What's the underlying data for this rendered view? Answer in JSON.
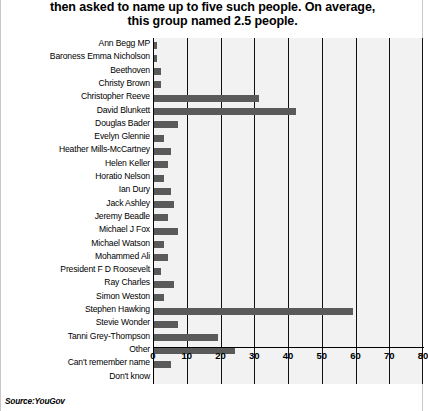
{
  "title": {
    "line1": "then asked to name up to five such people. On average,",
    "line2": "this group named 2.5 people."
  },
  "source": "Source:YouGov",
  "colors": {
    "bar": "#5a5a5a",
    "plot_background": "#f2f2f2",
    "gridline": "#111111",
    "text": "#000000"
  },
  "chart_data": {
    "type": "bar",
    "orientation": "horizontal",
    "title": "then asked to name up to five such people. On average, this group named 2.5 people.",
    "xlabel": "",
    "ylabel": "",
    "xlim": [
      0,
      80
    ],
    "xticks": [
      0,
      10,
      20,
      30,
      40,
      50,
      60,
      70,
      80
    ],
    "grid": true,
    "legend": false,
    "categories": [
      "Ann Begg MP",
      "Baroness Emma Nicholson",
      "Beethoven",
      "Christy Brown",
      "Christopher Reeve",
      "David Blunkett",
      "Douglas Bader",
      "Evelyn Glennie",
      "Heather Mills-McCartney",
      "Helen Keller",
      "Horatio Nelson",
      "Ian Dury",
      "Jack Ashley",
      "Jeremy Beadle",
      "Michael J Fox",
      "Michael Watson",
      "Mohammed Ali",
      "President F D Roosevelt",
      "Ray Charles",
      "Simon Weston",
      "Stephen Hawking",
      "Stevie Wonder",
      "Tanni Grey-Thompson",
      "Other",
      "Can't remember name",
      "Don't know"
    ],
    "values": [
      1,
      1,
      2,
      2,
      31,
      42,
      7,
      3,
      5,
      4,
      3,
      5,
      6,
      4,
      7,
      3,
      4,
      2,
      6,
      3,
      59,
      7,
      19,
      24,
      5,
      0
    ]
  }
}
